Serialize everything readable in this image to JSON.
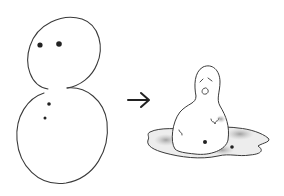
{
  "scene": {
    "description": "Hand-drawn sketch: a snowman, an arrow, then a melted snowman in a puddle",
    "colors": {
      "background": "#ffffff",
      "ink": "#3a3a3a",
      "dot": "#222222",
      "puddle_shade": "#9a9a9a"
    },
    "elements": [
      {
        "name": "snowman",
        "label": "Snowman"
      },
      {
        "name": "arrow",
        "label": "Arrow"
      },
      {
        "name": "melted-snowman",
        "label": "Melted snowman"
      }
    ]
  }
}
